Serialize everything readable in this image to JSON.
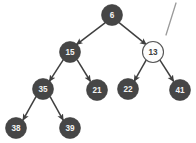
{
  "diagram": {
    "type": "binary-tree",
    "background_color": "#ffffff",
    "node_fill_color": "#464646",
    "node_text_color": "#f2f2f2",
    "highlight_node_fill_color": "#fdfdfd",
    "highlight_node_text_color": "#3d3d3d",
    "edge_color": "#3f3f3f",
    "stray_mark_color": "#9a9a9a",
    "nodes": [
      {
        "id": "n6",
        "label": "6",
        "cx": 112,
        "cy": 15,
        "r": 10.5,
        "style": "filled"
      },
      {
        "id": "n15",
        "label": "15",
        "cx": 70,
        "cy": 52,
        "r": 10.5,
        "style": "filled"
      },
      {
        "id": "n13",
        "label": "13",
        "cx": 153,
        "cy": 52,
        "r": 10.5,
        "style": "open"
      },
      {
        "id": "n35",
        "label": "35",
        "cx": 43,
        "cy": 89,
        "r": 10.5,
        "style": "filled"
      },
      {
        "id": "n21",
        "label": "21",
        "cx": 97,
        "cy": 90,
        "r": 10.5,
        "style": "filled"
      },
      {
        "id": "n22",
        "label": "22",
        "cx": 128,
        "cy": 89,
        "r": 10.5,
        "style": "filled"
      },
      {
        "id": "n41",
        "label": "41",
        "cx": 180,
        "cy": 90,
        "r": 10.5,
        "style": "filled"
      },
      {
        "id": "n38",
        "label": "38",
        "cx": 16,
        "cy": 128,
        "r": 10.5,
        "style": "filled"
      },
      {
        "id": "n39",
        "label": "39",
        "cx": 70,
        "cy": 128,
        "r": 10.5,
        "style": "filled"
      }
    ],
    "edges": [
      {
        "id": "e6-15",
        "from": "6",
        "to": "15",
        "arrow": true
      },
      {
        "id": "e6-13",
        "from": "6",
        "to": "13",
        "arrow": true
      },
      {
        "id": "e15-35",
        "from": "15",
        "to": "35",
        "arrow": true
      },
      {
        "id": "e15-21",
        "from": "15",
        "to": "21",
        "arrow": true
      },
      {
        "id": "e13-22",
        "from": "13",
        "to": "22",
        "arrow": true
      },
      {
        "id": "e13-41",
        "from": "13",
        "to": "41",
        "arrow": true
      },
      {
        "id": "e35-38",
        "from": "35",
        "to": "38",
        "arrow": true
      },
      {
        "id": "e35-39",
        "from": "35",
        "to": "39",
        "arrow": true
      }
    ],
    "stray_mark": {
      "x1": 176,
      "y1": 3,
      "x2": 166,
      "y2": 35
    }
  }
}
